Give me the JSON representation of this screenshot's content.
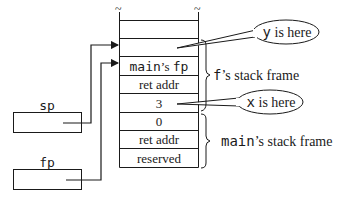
{
  "stack": {
    "cells": [
      {
        "id": "slot-empty-top",
        "label": ""
      },
      {
        "id": "slot-y",
        "label": ""
      },
      {
        "id": "slot-main-fp",
        "label_mono": "main",
        "label_serif": "’s ",
        "label_mono2": "fp"
      },
      {
        "id": "slot-ret-addr-f",
        "label": "ret addr"
      },
      {
        "id": "slot-3",
        "label": "3"
      },
      {
        "id": "slot-0",
        "label": "0"
      },
      {
        "id": "slot-ret-addr-main",
        "label": "ret addr"
      },
      {
        "id": "slot-reserved",
        "label": "reserved"
      }
    ],
    "continuation_mark": "~"
  },
  "registers": {
    "sp": {
      "label": "sp"
    },
    "fp": {
      "label": "fp"
    }
  },
  "callouts": {
    "y": {
      "var": "y",
      "text": " is here"
    },
    "x": {
      "var": "x",
      "text": " is here"
    }
  },
  "frames": {
    "f": {
      "name": "f",
      "suffix": "’s stack frame"
    },
    "main": {
      "name": "main",
      "suffix": "’s stack frame"
    }
  },
  "colors": {
    "stroke": "#1a1a1a",
    "background": "#ffffff"
  }
}
